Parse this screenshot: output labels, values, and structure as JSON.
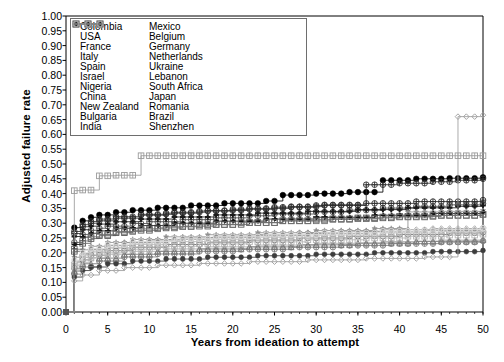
{
  "chart_data": {
    "type": "line",
    "title": "",
    "subtitle": "",
    "xlabel": "Years from ideation to attempt",
    "ylabel": "Adjusted failure rate",
    "xlim": [
      0,
      50
    ],
    "ylim": [
      0,
      1.0
    ],
    "xticks": [
      0,
      5,
      10,
      15,
      20,
      25,
      30,
      35,
      40,
      45,
      50
    ],
    "xtick_labels": [
      "0",
      "5",
      "10",
      "15",
      "20",
      "25",
      "30",
      "35",
      "40",
      "45",
      "50"
    ],
    "yticks": [
      0.0,
      0.05,
      0.1,
      0.15,
      0.2,
      0.25,
      0.3,
      0.35,
      0.4,
      0.45,
      0.5,
      0.55,
      0.6,
      0.65,
      0.7,
      0.75,
      0.8,
      0.85,
      0.9,
      0.95,
      1.0
    ],
    "ytick_labels": [
      "0.00",
      "0.05",
      "0.10",
      "0.15",
      "0.20",
      "0.25",
      "0.30",
      "0.35",
      "0.40",
      "0.45",
      "0.50",
      "0.55",
      "0.60",
      "0.65",
      "0.70",
      "0.75",
      "0.80",
      "0.85",
      "0.90",
      "0.95",
      "1.00"
    ],
    "grid": false,
    "step": "post",
    "legend_position": "upper-left-inside",
    "legend_columns": 2,
    "series": [
      {
        "name": "Colombia",
        "marker": "plus-circle",
        "color": "#4d4d4d",
        "x": [
          0,
          1,
          2,
          3,
          4,
          5,
          8,
          10,
          14,
          18,
          22,
          25,
          30,
          34,
          38,
          42,
          46,
          50
        ],
        "y": [
          0.0,
          0.235,
          0.262,
          0.276,
          0.283,
          0.29,
          0.299,
          0.305,
          0.312,
          0.318,
          0.325,
          0.331,
          0.338,
          0.344,
          0.351,
          0.357,
          0.362,
          0.367
        ]
      },
      {
        "name": "USA",
        "marker": "square-open",
        "color": "#5a5a5a",
        "x": [
          0,
          1,
          2,
          3,
          4,
          6,
          8,
          11,
          14,
          18,
          22,
          26,
          30,
          35,
          40,
          45,
          50
        ],
        "y": [
          0.0,
          0.205,
          0.232,
          0.248,
          0.258,
          0.268,
          0.276,
          0.284,
          0.29,
          0.296,
          0.302,
          0.308,
          0.313,
          0.318,
          0.323,
          0.327,
          0.33
        ]
      },
      {
        "name": "France",
        "marker": "diamond-open",
        "color": "#9e9e9e",
        "x": [
          0,
          1,
          2,
          3,
          5,
          7,
          10,
          14,
          18,
          23,
          28,
          33,
          38,
          44,
          50
        ],
        "y": [
          0.0,
          0.168,
          0.195,
          0.21,
          0.224,
          0.234,
          0.243,
          0.25,
          0.256,
          0.262,
          0.268,
          0.273,
          0.278,
          0.282,
          0.286
        ]
      },
      {
        "name": "Italy",
        "marker": "circle-light",
        "color": "#cccccc",
        "x": [
          0,
          1,
          2,
          3,
          5,
          8,
          12,
          16,
          21,
          26,
          31,
          37,
          43,
          50
        ],
        "y": [
          0.0,
          0.155,
          0.185,
          0.2,
          0.215,
          0.228,
          0.238,
          0.246,
          0.253,
          0.26,
          0.266,
          0.272,
          0.277,
          0.282
        ]
      },
      {
        "name": "Spain",
        "marker": "asterisk-circle",
        "color": "#2b2b2b",
        "x": [
          0,
          1,
          2,
          3,
          4,
          6,
          9,
          12,
          16,
          20,
          25,
          30,
          36,
          42,
          50
        ],
        "y": [
          0.0,
          0.265,
          0.288,
          0.3,
          0.308,
          0.317,
          0.327,
          0.334,
          0.341,
          0.347,
          0.354,
          0.36,
          0.367,
          0.373,
          0.378
        ]
      },
      {
        "name": "Israel",
        "marker": "circle-open",
        "color": "#6b6b6b",
        "x": [
          0,
          1,
          2,
          3,
          5,
          8,
          12,
          17,
          22,
          28,
          34,
          40,
          46,
          50
        ],
        "y": [
          0.0,
          0.148,
          0.176,
          0.192,
          0.207,
          0.219,
          0.228,
          0.236,
          0.243,
          0.25,
          0.256,
          0.262,
          0.267,
          0.27
        ]
      },
      {
        "name": "Nigeria",
        "marker": "y-circle",
        "color": "#7d7d7d",
        "x": [
          0,
          1,
          2,
          4,
          7,
          11,
          16,
          21,
          27,
          33,
          39,
          45,
          50
        ],
        "y": [
          0.0,
          0.128,
          0.152,
          0.172,
          0.186,
          0.196,
          0.205,
          0.212,
          0.219,
          0.225,
          0.231,
          0.236,
          0.24
        ]
      },
      {
        "name": "China",
        "marker": "plus-bold",
        "color": "#1a1a1a",
        "x": [
          0,
          1,
          2,
          3,
          4,
          6,
          9,
          13,
          18,
          23,
          29,
          35,
          41,
          47,
          50
        ],
        "y": [
          0.0,
          0.255,
          0.278,
          0.29,
          0.297,
          0.305,
          0.314,
          0.321,
          0.328,
          0.334,
          0.34,
          0.346,
          0.352,
          0.357,
          0.36
        ]
      },
      {
        "name": "New Zealand",
        "marker": "tri-open",
        "color": "#8a8a8a",
        "x": [
          0,
          1,
          2,
          3,
          5,
          8,
          12,
          17,
          23,
          29,
          36,
          43,
          50
        ],
        "y": [
          0.0,
          0.172,
          0.198,
          0.212,
          0.225,
          0.236,
          0.245,
          0.252,
          0.259,
          0.265,
          0.271,
          0.276,
          0.281
        ]
      },
      {
        "name": "Bulgaria",
        "marker": "circle-filled-mid",
        "color": "#3d3d3d",
        "x": [
          0,
          1,
          2,
          3,
          5,
          8,
          12,
          17,
          23,
          30,
          37,
          44,
          50
        ],
        "y": [
          0.0,
          0.118,
          0.14,
          0.152,
          0.163,
          0.172,
          0.179,
          0.185,
          0.19,
          0.195,
          0.2,
          0.204,
          0.208
        ]
      },
      {
        "name": "India",
        "marker": "tri-up-open",
        "color": "#a8a8a8",
        "x": [
          0,
          1,
          2,
          3,
          5,
          8,
          12,
          17,
          23,
          30,
          38,
          45,
          50
        ],
        "y": [
          0.0,
          0.142,
          0.168,
          0.182,
          0.195,
          0.205,
          0.213,
          0.22,
          0.226,
          0.232,
          0.238,
          0.243,
          0.247
        ]
      },
      {
        "name": "Mexico",
        "marker": "circle-filled",
        "color": "#000000",
        "x": [
          0,
          1,
          2,
          3,
          4,
          6,
          8,
          11,
          15,
          19,
          24,
          26,
          30,
          34,
          38,
          42,
          46,
          50
        ],
        "y": [
          0.0,
          0.285,
          0.308,
          0.32,
          0.328,
          0.337,
          0.344,
          0.352,
          0.36,
          0.367,
          0.375,
          0.395,
          0.4,
          0.405,
          0.445,
          0.45,
          0.452,
          0.455
        ]
      },
      {
        "name": "Belgium",
        "marker": "tri-up-small",
        "color": "#757575",
        "x": [
          0,
          1,
          2,
          4,
          7,
          11,
          16,
          22,
          28,
          35,
          42,
          50
        ],
        "y": [
          0.0,
          0.138,
          0.163,
          0.182,
          0.195,
          0.205,
          0.213,
          0.22,
          0.227,
          0.233,
          0.239,
          0.244
        ]
      },
      {
        "name": "Germany",
        "marker": "diamond-circle",
        "color": "#2f2f2f",
        "x": [
          0,
          1,
          2,
          3,
          4,
          6,
          9,
          13,
          17,
          22,
          27,
          31,
          36,
          40,
          44,
          47,
          50
        ],
        "y": [
          0.0,
          0.272,
          0.295,
          0.306,
          0.314,
          0.322,
          0.33,
          0.337,
          0.343,
          0.35,
          0.356,
          0.362,
          0.43,
          0.435,
          0.44,
          0.445,
          0.45
        ]
      },
      {
        "name": "Netherlands",
        "marker": "grid-square",
        "color": "#9a9a9a",
        "x": [
          0,
          1,
          2,
          4,
          6,
          9,
          14,
          20,
          26,
          32,
          38,
          44,
          50
        ],
        "y": [
          0.0,
          0.41,
          0.412,
          0.46,
          0.462,
          0.528,
          0.528,
          0.528,
          0.528,
          0.528,
          0.528,
          0.528,
          0.528
        ]
      },
      {
        "name": "Ukraine",
        "marker": "star-grey",
        "color": "#8f8f8f",
        "x": [
          0,
          1,
          2,
          3,
          5,
          8,
          12,
          17,
          23,
          30,
          37,
          41,
          45,
          50
        ],
        "y": [
          0.0,
          0.185,
          0.21,
          0.222,
          0.235,
          0.245,
          0.254,
          0.261,
          0.268,
          0.275,
          0.282,
          0.338,
          0.34,
          0.343
        ]
      },
      {
        "name": "Lebanon",
        "marker": "square-small-grey",
        "color": "#b5b5b5",
        "x": [
          0,
          1,
          2,
          4,
          7,
          11,
          16,
          22,
          29,
          36,
          41,
          46,
          50
        ],
        "y": [
          0.0,
          0.158,
          0.184,
          0.2,
          0.212,
          0.222,
          0.23,
          0.237,
          0.244,
          0.25,
          0.256,
          0.26,
          0.263
        ]
      },
      {
        "name": "South Africa",
        "marker": "circle-split",
        "color": "#c2c2c2",
        "x": [
          0,
          1,
          2,
          3,
          5,
          8,
          12,
          17,
          23,
          30,
          38,
          45,
          50
        ],
        "y": [
          0.0,
          0.162,
          0.19,
          0.205,
          0.218,
          0.229,
          0.238,
          0.246,
          0.253,
          0.26,
          0.267,
          0.272,
          0.276
        ]
      },
      {
        "name": "Japan",
        "marker": "circle-pale",
        "color": "#dcdcdc",
        "x": [
          0,
          1,
          2,
          3,
          5,
          8,
          13,
          18,
          24,
          31,
          38,
          45,
          50
        ],
        "y": [
          0.0,
          0.175,
          0.2,
          0.214,
          0.227,
          0.238,
          0.247,
          0.254,
          0.261,
          0.267,
          0.273,
          0.278,
          0.283
        ]
      },
      {
        "name": "Romania",
        "marker": "arrow-bold",
        "color": "#141414",
        "x": [
          0,
          1,
          2,
          3,
          4,
          6,
          9,
          13,
          18,
          24,
          30,
          37,
          44,
          50
        ],
        "y": [
          0.0,
          0.228,
          0.253,
          0.266,
          0.274,
          0.283,
          0.292,
          0.3,
          0.307,
          0.314,
          0.32,
          0.327,
          0.333,
          0.338
        ]
      },
      {
        "name": "Brazil",
        "marker": "h-square",
        "color": "#6f6f6f",
        "x": [
          0,
          1,
          2,
          3,
          4,
          6,
          9,
          12,
          16,
          21,
          26,
          32,
          38,
          44,
          50
        ],
        "y": [
          0.0,
          0.212,
          0.24,
          0.254,
          0.262,
          0.272,
          0.281,
          0.288,
          0.295,
          0.302,
          0.308,
          0.315,
          0.321,
          0.326,
          0.33
        ]
      },
      {
        "name": "Shenzhen",
        "marker": "diamond-small",
        "color": "#9c9c9c",
        "x": [
          0,
          1,
          2,
          4,
          7,
          11,
          16,
          22,
          29,
          36,
          43,
          47,
          50
        ],
        "y": [
          0.0,
          0.105,
          0.125,
          0.14,
          0.15,
          0.158,
          0.164,
          0.17,
          0.176,
          0.181,
          0.186,
          0.66,
          0.665
        ]
      }
    ]
  },
  "legend": {
    "column1": [
      {
        "label": "Colombia",
        "marker": "plus-circle",
        "color": "#4d4d4d"
      },
      {
        "label": "USA",
        "marker": "square-open",
        "color": "#5a5a5a"
      },
      {
        "label": "France",
        "marker": "diamond-open",
        "color": "#9e9e9e"
      },
      {
        "label": "Italy",
        "marker": "circle-light",
        "color": "#cccccc"
      },
      {
        "label": "Spain",
        "marker": "asterisk-circle",
        "color": "#2b2b2b"
      },
      {
        "label": "Israel",
        "marker": "circle-open",
        "color": "#6b6b6b"
      },
      {
        "label": "Nigeria",
        "marker": "y-circle",
        "color": "#7d7d7d"
      },
      {
        "label": "China",
        "marker": "plus-bold",
        "color": "#1a1a1a"
      },
      {
        "label": "New Zealand",
        "marker": "tri-open",
        "color": "#8a8a8a"
      },
      {
        "label": "Bulgaria",
        "marker": "circle-filled-mid",
        "color": "#3d3d3d"
      },
      {
        "label": "India",
        "marker": "tri-up-open",
        "color": "#a8a8a8"
      }
    ],
    "column2": [
      {
        "label": "Mexico",
        "marker": "circle-filled",
        "color": "#000000"
      },
      {
        "label": "Belgium",
        "marker": "tri-up-small",
        "color": "#757575"
      },
      {
        "label": "Germany",
        "marker": "diamond-circle",
        "color": "#2f2f2f"
      },
      {
        "label": "Netherlands",
        "marker": "grid-square",
        "color": "#9a9a9a"
      },
      {
        "label": "Ukraine",
        "marker": "star-grey",
        "color": "#8f8f8f"
      },
      {
        "label": "Lebanon",
        "marker": "square-small-grey",
        "color": "#b5b5b5"
      },
      {
        "label": "South Africa",
        "marker": "circle-split",
        "color": "#c2c2c2"
      },
      {
        "label": "Japan",
        "marker": "circle-pale",
        "color": "#dcdcdc"
      },
      {
        "label": "Romania",
        "marker": "arrow-bold",
        "color": "#141414"
      },
      {
        "label": "Brazil",
        "marker": "h-square",
        "color": "#6f6f6f"
      },
      {
        "label": "Shenzhen",
        "marker": "diamond-small",
        "color": "#9c9c9c"
      }
    ]
  }
}
